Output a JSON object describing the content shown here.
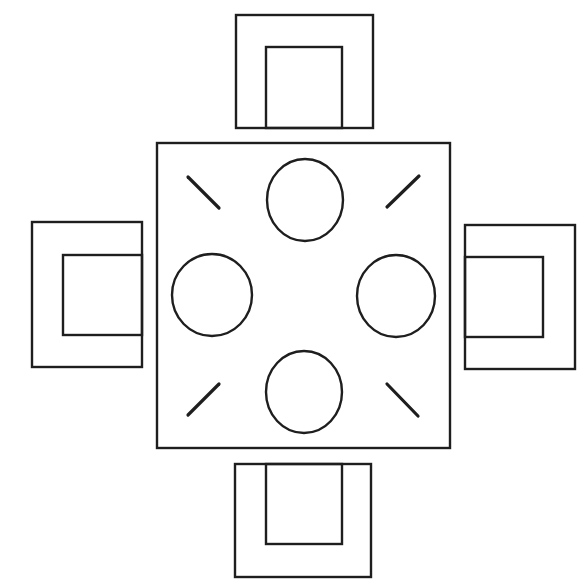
{
  "diagram": {
    "title": "Square dining table with four chairs",
    "canvas": {
      "width": 588,
      "height": 588
    },
    "colors": {
      "line": "#1e1e1e",
      "background": "#ffffff"
    },
    "table": {
      "x": 157,
      "y": 143,
      "width": 293,
      "height": 305
    },
    "place_settings": [
      {
        "id": "top",
        "cx": 305,
        "cy": 200,
        "rx": 38,
        "ry": 41
      },
      {
        "id": "left",
        "cx": 212,
        "cy": 295,
        "rx": 40,
        "ry": 41
      },
      {
        "id": "right",
        "cx": 396,
        "cy": 296,
        "rx": 39,
        "ry": 41
      },
      {
        "id": "bottom",
        "cx": 304,
        "cy": 392,
        "rx": 38,
        "ry": 41
      }
    ],
    "corner_marks": [
      {
        "id": "top-left",
        "x1": 188,
        "y1": 177,
        "x2": 219,
        "y2": 208
      },
      {
        "id": "top-right",
        "x1": 387,
        "y1": 207,
        "x2": 419,
        "y2": 176
      },
      {
        "id": "bottom-left",
        "x1": 188,
        "y1": 415,
        "x2": 219,
        "y2": 384
      },
      {
        "id": "bottom-right",
        "x1": 387,
        "y1": 384,
        "x2": 418,
        "y2": 416
      }
    ],
    "chairs": [
      {
        "id": "top",
        "outer": {
          "x": 236,
          "y": 15,
          "w": 137,
          "h": 113
        },
        "inner": {
          "x": 266,
          "y": 47,
          "w": 76,
          "h": 81
        }
      },
      {
        "id": "left",
        "outer": {
          "x": 32,
          "y": 222,
          "w": 110,
          "h": 145
        },
        "inner": {
          "x": 63,
          "y": 255,
          "w": 79,
          "h": 80
        }
      },
      {
        "id": "right",
        "outer": {
          "x": 465,
          "y": 225,
          "w": 110,
          "h": 144
        },
        "inner": {
          "x": 465,
          "y": 257,
          "w": 78,
          "h": 80
        }
      },
      {
        "id": "bottom",
        "outer": {
          "x": 235,
          "y": 464,
          "w": 136,
          "h": 113
        },
        "inner": {
          "x": 266,
          "y": 464,
          "w": 76,
          "h": 80
        }
      }
    ]
  }
}
